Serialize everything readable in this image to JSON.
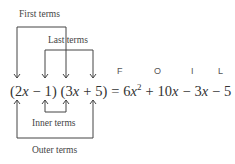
{
  "labels": {
    "first_terms": "First terms",
    "last_terms": "Last terms",
    "inner_terms": "Inner terms",
    "outer_terms": "Outer terms"
  },
  "foil": [
    "F",
    "O",
    "I",
    "L"
  ],
  "equation": {
    "lhs_factor1": "(2x − 1)",
    "lhs_factor2": "(3x + 5)",
    "equals": "=",
    "rhs": "6x² + 10x − 3x − 5",
    "parts": {
      "p1_open": "(2",
      "p1_var": "x",
      "p1_rest": " − 1)",
      "p2_open": " (3",
      "p2_var": "x",
      "p2_rest": " + 5)",
      "eq": " = ",
      "t1": "6",
      "t1_var": "x",
      "t1_exp": "2",
      "t2": " + 10",
      "t2_var": "x",
      "t3": " − 3",
      "t3_var": "x",
      "t4": " − 5"
    }
  },
  "colors": {
    "line": "#444444",
    "text": "#333333"
  }
}
